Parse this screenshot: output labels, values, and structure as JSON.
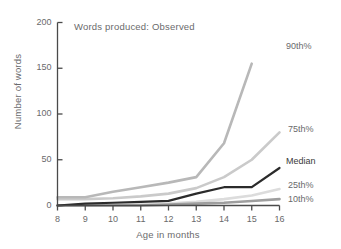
{
  "chart_data": {
    "type": "line",
    "title": "Words produced: Observed",
    "xlabel": "Age in months",
    "ylabel": "Number of words",
    "xlim": [
      8,
      16
    ],
    "ylim": [
      0,
      200
    ],
    "yticks": [
      0,
      50,
      100,
      150,
      200
    ],
    "xticks": [
      8,
      9,
      10,
      11,
      12,
      13,
      14,
      15,
      16
    ],
    "grid": false,
    "legend_position": "right-inline-labels",
    "x": [
      8,
      9,
      10,
      11,
      12,
      13,
      14,
      15,
      16
    ],
    "series": [
      {
        "name": "90th%",
        "label": "90th%",
        "color": "#b8b8b8",
        "x": [
          8,
          9,
          10,
          11,
          12,
          13,
          14,
          15
        ],
        "values": [
          9,
          9,
          15,
          20,
          25,
          31,
          68,
          155
        ]
      },
      {
        "name": "75th%",
        "label": "75th%",
        "color": "#cacaca",
        "x": [
          8,
          9,
          10,
          11,
          12,
          13,
          14,
          15,
          16
        ],
        "values": [
          7,
          7,
          8,
          10,
          13,
          19,
          31,
          50,
          80
        ]
      },
      {
        "name": "Median",
        "label": "Median",
        "color": "#2b2b2b",
        "x": [
          8,
          9,
          10,
          11,
          12,
          13,
          14,
          15,
          16
        ],
        "values": [
          0,
          2,
          3,
          4,
          5,
          13,
          20,
          20,
          41
        ]
      },
      {
        "name": "25th%",
        "label": "25th%",
        "color": "#dcdcdc",
        "x": [
          8,
          9,
          10,
          11,
          12,
          13,
          14,
          15,
          16
        ],
        "values": [
          0,
          0,
          1,
          1,
          2,
          4,
          7,
          11,
          18
        ]
      },
      {
        "name": "10th%",
        "label": "10th%",
        "color": "#9e9e9e",
        "x": [
          8,
          9,
          10,
          11,
          12,
          13,
          14,
          15,
          16
        ],
        "values": [
          0,
          0,
          0,
          0,
          1,
          2,
          3,
          5,
          7
        ]
      }
    ]
  },
  "axes": {
    "y_title": "Number of words",
    "x_title": "Age in months",
    "y_ticks": [
      "200",
      "150",
      "100",
      "50",
      "0"
    ],
    "x_ticks": [
      "8",
      "9",
      "10",
      "11",
      "12",
      "13",
      "14",
      "15",
      "16"
    ]
  },
  "labels": {
    "p90": "90th%",
    "p75": "75th%",
    "median": "Median",
    "p25": "25th%",
    "p10": "10th%"
  },
  "colors": {
    "p90": "#b8b8b8",
    "p75": "#cacaca",
    "median": "#2b2b2b",
    "p25": "#dcdcdc",
    "p10": "#9e9e9e",
    "axis": "#4a4a4a",
    "text": "#6a6a6c"
  }
}
